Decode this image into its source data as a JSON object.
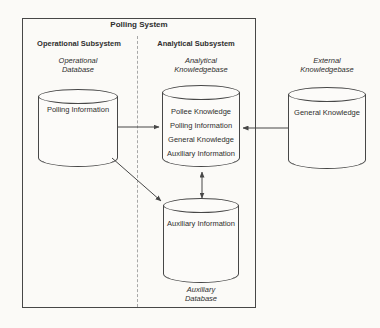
{
  "palette": {
    "background": "#fbfaf7",
    "line": "#474747",
    "text": "#2e2e2e",
    "divider_dash": "#a8a8a8"
  },
  "diagram": {
    "title": "Polling System",
    "left_heading": "Operational Subsystem",
    "right_heading": "Analytical Subsystem",
    "operational_db": {
      "label1": "Operational",
      "label2": "Database",
      "items": [
        "Polling Information"
      ]
    },
    "analytical_kb": {
      "label1": "Analytical",
      "label2": "Knowledgebase",
      "items": [
        "Pollee Knowledge",
        "Polling Information",
        "General Knowledge",
        "Auxiliary Information"
      ]
    },
    "external_kb": {
      "label1": "External",
      "label2": "Knowledgebase",
      "items": [
        "General Knowledge"
      ]
    },
    "auxiliary_db": {
      "label1": "Auxiliary",
      "label2": "Database",
      "items": [
        "Auxiliary Information"
      ]
    },
    "connections": [
      {
        "from": "operational-database",
        "to": "analytical-knowledgebase",
        "style": "single-arrow"
      },
      {
        "from": "external-knowledgebase",
        "to": "analytical-knowledgebase",
        "style": "single-arrow"
      },
      {
        "from": "operational-database",
        "to": "auxiliary-database",
        "style": "single-arrow"
      },
      {
        "from": "analytical-knowledgebase",
        "to": "auxiliary-database",
        "style": "double-arrow"
      }
    ]
  }
}
